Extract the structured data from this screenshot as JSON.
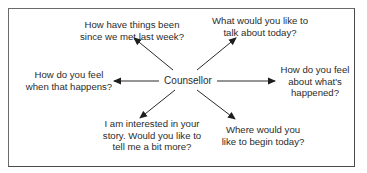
{
  "diagram": {
    "type": "hub-and-spoke",
    "center": {
      "label": "Counsellor"
    },
    "nodes": [
      {
        "id": "top-left",
        "label": "How have things been\nsince we met last week?"
      },
      {
        "id": "top-right",
        "label": "What would you like to\ntalk about today?"
      },
      {
        "id": "left",
        "label": "How do you feel\nwhen that happens?"
      },
      {
        "id": "right",
        "label": "How do you feel\nabout what's\nhappened?"
      },
      {
        "id": "bottom-left",
        "label": "I am interested in your\nstory. Would you like to\ntell me a bit more?"
      },
      {
        "id": "bottom-right",
        "label": "Where would you\nlike to begin today?"
      }
    ],
    "edges": [
      {
        "from": "center",
        "to": "top-left"
      },
      {
        "from": "center",
        "to": "top-right"
      },
      {
        "from": "center",
        "to": "left"
      },
      {
        "from": "center",
        "to": "right"
      },
      {
        "from": "center",
        "to": "bottom-left"
      },
      {
        "from": "center",
        "to": "bottom-right"
      }
    ],
    "colors": {
      "line": "#2a2a2a",
      "text": "#2b2b2b",
      "border": "#5a5a5a"
    }
  }
}
